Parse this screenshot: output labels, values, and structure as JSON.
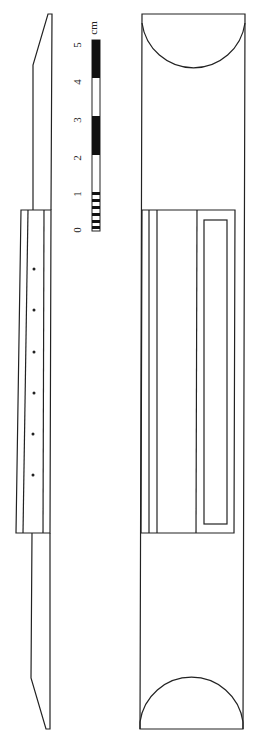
{
  "figure": {
    "stroke_color": "#222222",
    "background": "#ffffff"
  },
  "scale_bar": {
    "unit": "cm",
    "labels": [
      "0",
      "1",
      "2",
      "3",
      "4",
      "5"
    ],
    "fill_dark": "#111111",
    "fill_light": "#ffffff"
  },
  "side_view": {
    "dot_count": 6
  },
  "top_view": {
    "end_shapes": "semicircle"
  }
}
